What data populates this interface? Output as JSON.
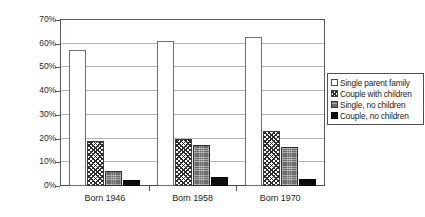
{
  "chart_data": {
    "type": "bar",
    "title": "",
    "subtitle": "",
    "xlabel": "",
    "ylabel": "",
    "categories": [
      "Born 1946",
      "Born 1958",
      "Born 1970"
    ],
    "series": [
      {
        "name": "Single parent family",
        "values": [
          57.5,
          61.0,
          63.0
        ],
        "swatch": "white-outline"
      },
      {
        "name": "Couple with children",
        "values": [
          19.0,
          20.0,
          23.0
        ],
        "swatch": "crosshatch"
      },
      {
        "name": "Single, no children",
        "values": [
          6.5,
          17.5,
          16.5
        ],
        "swatch": "gray-fill"
      },
      {
        "name": "Couple, no children",
        "values": [
          2.5,
          4.0,
          3.0
        ],
        "swatch": "black-fill"
      }
    ],
    "ylim": [
      0,
      70
    ],
    "ytick_values": [
      0,
      10,
      20,
      30,
      40,
      50,
      60,
      70
    ],
    "ytick_labels": [
      "0%",
      "10%",
      "20%",
      "30%",
      "40%",
      "50%",
      "60%",
      "70%"
    ],
    "grid": true,
    "legend_position": "right"
  },
  "legend": {
    "items": [
      {
        "label": "Single parent family"
      },
      {
        "label": "Couple with children"
      },
      {
        "label": "Single, no children"
      },
      {
        "label": "Couple, no children"
      }
    ]
  },
  "colors": {
    "axis": "#5a5a5a",
    "gridline": "#b4b4b4",
    "text": "#1f1f1f",
    "series_white": "#ffffff",
    "series_gray": "#6b6b6b",
    "series_black": "#0d0d0d",
    "background": "#ffffff"
  }
}
